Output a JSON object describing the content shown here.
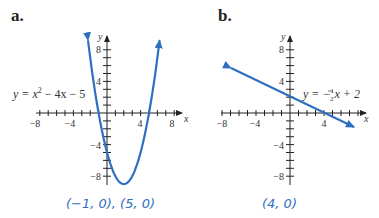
{
  "panels": [
    {
      "label": "a.",
      "equation": "y = x² − 4x − 5",
      "eq_parts": {
        "lhs": "y = x",
        "exp": "2",
        "rhs": " − 4x − 5"
      },
      "answer": "(−1, 0), (5, 0)",
      "x_ticks": [
        "−8",
        "−4",
        "4",
        "8"
      ],
      "y_ticks": [
        "8",
        "4",
        "−4",
        "−8"
      ],
      "x_axis_label": "x",
      "y_axis_label": "y"
    },
    {
      "label": "b.",
      "equation": "y = −½x + 2",
      "eq_parts": {
        "lhs": "y = −",
        "num": "1",
        "den": "2",
        "rhs": "x + 2"
      },
      "answer": "(4, 0)",
      "x_ticks": [
        "−8",
        "−4",
        "4"
      ],
      "y_ticks": [
        "8",
        "4",
        "−4",
        "−8"
      ],
      "x_axis_label": "x",
      "y_axis_label": "y"
    }
  ],
  "colors": {
    "curve": "#2f6fc0",
    "axis": "#222222",
    "caption": "#2f6fc0"
  },
  "chart_data": [
    {
      "type": "line",
      "title": "a.",
      "function": "y = x^2 - 4x - 5",
      "xlabel": "x",
      "ylabel": "y",
      "xlim": [
        -8.5,
        9
      ],
      "ylim": [
        -9,
        9.5
      ],
      "x_ticks": [
        -8,
        -4,
        4,
        8
      ],
      "y_ticks": [
        8,
        4,
        -4,
        -8
      ],
      "grid": false,
      "vertex": [
        2,
        -9
      ],
      "x_intercepts": [
        [
          -1,
          0
        ],
        [
          5,
          0
        ]
      ],
      "y_intercept": [
        0,
        -5
      ],
      "annotation": "(−1, 0), (5, 0)"
    },
    {
      "type": "line",
      "title": "b.",
      "function": "y = -1/2 x + 2",
      "xlabel": "x",
      "ylabel": "y",
      "xlim": [
        -8.5,
        9
      ],
      "ylim": [
        -9,
        9.5
      ],
      "x_ticks": [
        -8,
        -4,
        4
      ],
      "y_ticks": [
        8,
        4,
        -4,
        -8
      ],
      "grid": false,
      "x_intercepts": [
        [
          4,
          0
        ]
      ],
      "y_intercept": [
        0,
        2
      ],
      "annotation": "(4, 0)"
    }
  ]
}
